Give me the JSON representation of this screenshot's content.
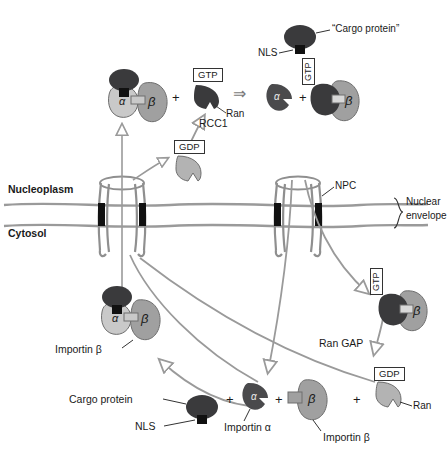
{
  "figure": {
    "type": "cell-biology-diagram"
  },
  "colors": {
    "cargo_dark": "#3a3a3c",
    "nls_black": "#111111",
    "importin_alpha": "#c9c9c9",
    "importin_beta": "#a0a0a0",
    "ran_dark": "#3a3a3c",
    "ran_light": "#b3b3b3",
    "membrane_gray": "#9a9a9a",
    "npc_gray": "#8f8f8f",
    "arrow_gray": "#9a9a9a",
    "text_black": "#1a1a1a",
    "background": "#ffffff"
  },
  "compartments": {
    "nucleoplasm_label": "Nucleoplasm",
    "cytosol_label": "Cytosol",
    "envelope_label_line1": "Nuclear",
    "envelope_label_line2": "envelope",
    "npc_label": "NPC"
  },
  "top_row": {
    "cargo_callout": "“Cargo protein”",
    "nls_callout": "NLS",
    "complex_alpha": "α",
    "complex_beta": "β",
    "plus_1": "+",
    "ran_gtp_tag": "GTP",
    "ran_label": "Ran",
    "rcc1_label": "RCC1",
    "reaction_arrow": "⇒",
    "free_alpha": "α",
    "plus_2": "+",
    "beta_gtp_tag": "GTP",
    "beta_label": "β",
    "gdp_tag": "GDP"
  },
  "bottom_row": {
    "importin_beta_complex_label": "Importin β",
    "complex_alpha": "α",
    "complex_beta": "β",
    "gtp_tag_right": "GTP",
    "beta_right_label": "β",
    "ran_gap_label": "Ran GAP",
    "gdp_tag": "GDP",
    "ran_label": "Ran",
    "cargo_protein_label": "Cargo protein",
    "nls_label": "NLS",
    "plus_1": "+",
    "importin_alpha_glyph": "α",
    "importin_alpha_label": "Importin α",
    "plus_2": "+",
    "importin_beta_glyph": "β",
    "importin_beta_label": "Importin β",
    "plus_3": "+"
  }
}
